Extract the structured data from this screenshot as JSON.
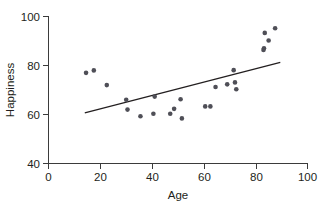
{
  "chart_data": {
    "type": "scatter",
    "title": "",
    "xlabel": "Age",
    "ylabel": "Happiness",
    "xlim": [
      0,
      100
    ],
    "ylim": [
      40,
      100
    ],
    "xticks": [
      0,
      20,
      40,
      60,
      80,
      100
    ],
    "yticks": [
      40,
      60,
      80,
      100
    ],
    "grid": false,
    "legend": null,
    "point_color": "#4f4f57",
    "line_color": "#231f20",
    "points": [
      {
        "x": 14.5,
        "y": 77.0
      },
      {
        "x": 17.5,
        "y": 78.0
      },
      {
        "x": 22.5,
        "y": 72.0
      },
      {
        "x": 30.0,
        "y": 66.0
      },
      {
        "x": 30.5,
        "y": 62.0
      },
      {
        "x": 35.5,
        "y": 59.3
      },
      {
        "x": 40.5,
        "y": 60.3
      },
      {
        "x": 41.0,
        "y": 67.3
      },
      {
        "x": 47.0,
        "y": 60.3
      },
      {
        "x": 48.5,
        "y": 62.3
      },
      {
        "x": 51.0,
        "y": 66.2
      },
      {
        "x": 51.5,
        "y": 58.4
      },
      {
        "x": 60.5,
        "y": 63.3
      },
      {
        "x": 62.5,
        "y": 63.3
      },
      {
        "x": 64.5,
        "y": 71.2
      },
      {
        "x": 69.0,
        "y": 72.3
      },
      {
        "x": 71.5,
        "y": 78.1
      },
      {
        "x": 72.0,
        "y": 73.1
      },
      {
        "x": 72.5,
        "y": 70.3
      },
      {
        "x": 83.0,
        "y": 86.3
      },
      {
        "x": 83.2,
        "y": 87.0
      },
      {
        "x": 83.5,
        "y": 93.3
      },
      {
        "x": 85.0,
        "y": 90.2
      },
      {
        "x": 87.5,
        "y": 95.2
      }
    ],
    "trendline": {
      "x_start": 14.0,
      "y_start": 60.7,
      "x_end": 89.5,
      "y_end": 81.3
    }
  },
  "axes": {
    "y_tick_labels": [
      "100",
      "80",
      "60",
      "40"
    ],
    "x_tick_labels": [
      "0",
      "20",
      "40",
      "60",
      "80",
      "100"
    ],
    "x_axis_title": "Age",
    "y_axis_title": "Happiness"
  }
}
